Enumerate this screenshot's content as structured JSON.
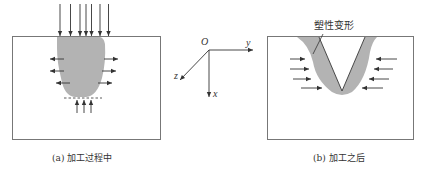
{
  "figure": {
    "panel_a": {
      "caption": "(a) 加工过程中",
      "description": "During machining: downward force arrows at top, plastic zone with outward lateral arrows, upward arrows below dashed line"
    },
    "panel_b": {
      "caption": "(b) 加工之后",
      "annotation": "塑性变形",
      "description": "After machining: V-groove surrounded by plastic deformation zone with inward lateral arrows"
    },
    "axes": {
      "origin": "O",
      "x": "x",
      "y": "y",
      "z": "z"
    },
    "colors": {
      "plastic_zone": "#b3b3b3",
      "line": "#555555",
      "frame": "#777777"
    }
  }
}
